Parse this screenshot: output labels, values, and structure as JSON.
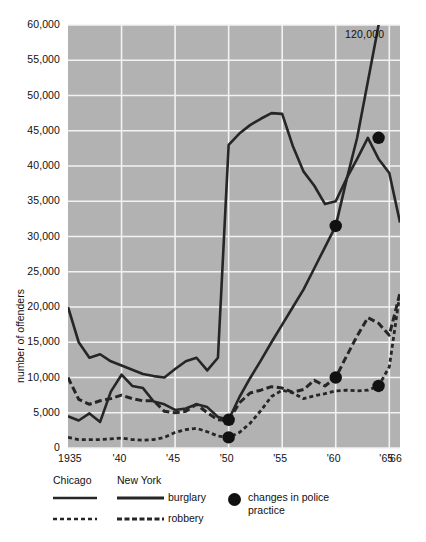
{
  "chart_data": {
    "type": "line",
    "title": "",
    "xlabel": "",
    "ylabel": "number of offenders",
    "xlim": [
      1935,
      1966
    ],
    "ylim": [
      0,
      60000
    ],
    "grid": true,
    "legend_position": "below",
    "annotations": [
      {
        "text": "120,000",
        "x": 1964.6,
        "y": 58000,
        "note": "Chicago burglary value off the top of the scale"
      }
    ],
    "y_ticks": [
      0,
      5000,
      10000,
      15000,
      20000,
      25000,
      30000,
      35000,
      40000,
      45000,
      50000,
      55000,
      60000
    ],
    "y_tick_labels": [
      "0",
      "5,000",
      "10,000",
      "15,000",
      "20,000",
      "25,000",
      "30,000",
      "35,000",
      "40,000",
      "45,000",
      "50,000",
      "55,000",
      "60,000"
    ],
    "x_ticks": [
      1935,
      1940,
      1945,
      1950,
      1955,
      1960,
      1965,
      1966
    ],
    "x_tick_labels": [
      "1935",
      "'40",
      "'45",
      "'50",
      "'55",
      "'60",
      "'65",
      "'66"
    ],
    "x": [
      1935,
      1936,
      1937,
      1938,
      1939,
      1940,
      1941,
      1942,
      1943,
      1944,
      1945,
      1946,
      1947,
      1948,
      1949,
      1950,
      1951,
      1952,
      1953,
      1954,
      1955,
      1956,
      1957,
      1958,
      1959,
      1960,
      1961,
      1962,
      1963,
      1964,
      1965,
      1966
    ],
    "series": [
      {
        "name": "New York burglary",
        "city": "New York",
        "offense": "burglary",
        "style": "solid",
        "color": "#262626",
        "values": [
          20000,
          15000,
          12800,
          13300,
          12300,
          11700,
          11100,
          10500,
          10200,
          10000,
          11200,
          12300,
          12800,
          11000,
          12800,
          43000,
          44600,
          45800,
          46700,
          47500,
          47400,
          42800,
          39200,
          37200,
          34600,
          35000,
          38200,
          41000,
          44000,
          41000,
          39000,
          32000
        ]
      },
      {
        "name": "New York robbery",
        "city": "New York",
        "offense": "robbery",
        "style": "dashed-wide",
        "color": "#262626",
        "values": [
          10000,
          6900,
          6200,
          6700,
          7000,
          7500,
          7000,
          6700,
          6700,
          5200,
          5000,
          5200,
          6200,
          5000,
          4000,
          3900,
          6400,
          7800,
          8200,
          8700,
          8500,
          7900,
          8300,
          9600,
          8800,
          10000,
          13000,
          15900,
          18500,
          17700,
          16000,
          22000
        ]
      },
      {
        "name": "Chicago burglary",
        "city": "Chicago",
        "offense": "burglary",
        "style": "solid",
        "color": "#262626",
        "values": [
          4500,
          3900,
          4900,
          3700,
          8000,
          10400,
          8800,
          8500,
          6600,
          6200,
          5400,
          5600,
          6200,
          5800,
          4400,
          4000,
          7200,
          9900,
          12400,
          15000,
          17500,
          20000,
          22500,
          25500,
          28500,
          31500,
          38000,
          44000,
          52000,
          60000,
          90000,
          120000
        ]
      },
      {
        "name": "Chicago robbery",
        "city": "Chicago",
        "offense": "robbery",
        "style": "dotted",
        "color": "#262626",
        "values": [
          1500,
          1200,
          1200,
          1200,
          1300,
          1400,
          1200,
          1100,
          1200,
          1500,
          2200,
          2600,
          2800,
          2300,
          1700,
          1500,
          2200,
          3500,
          5300,
          7300,
          8200,
          7800,
          7000,
          7400,
          7700,
          8100,
          8200,
          8100,
          8200,
          8800,
          11500,
          22000
        ]
      }
    ],
    "markers": {
      "label": "changes in police practice",
      "points": [
        {
          "x": 1950,
          "y": 4000,
          "series": "Chicago burglary"
        },
        {
          "x": 1950,
          "y": 1500,
          "series": "Chicago robbery"
        },
        {
          "x": 1960,
          "y": 31500,
          "series": "Chicago burglary"
        },
        {
          "x": 1960,
          "y": 10000,
          "series": "New York robbery"
        },
        {
          "x": 1964,
          "y": 44000,
          "series": "Chicago burglary"
        },
        {
          "x": 1964,
          "y": 8800,
          "series": "Chicago robbery"
        }
      ]
    },
    "legend": {
      "columns": [
        "Chicago",
        "New York"
      ],
      "rows": [
        {
          "label": "burglary",
          "style": "solid"
        },
        {
          "label": "robbery",
          "style": "dashed"
        }
      ],
      "marker_label_line1": "changes in police",
      "marker_label_line2": "practice"
    },
    "colors": {
      "plot_background": "#b2b2b2",
      "gridline": "#f2f2f2",
      "line": "#262626",
      "page_background": "#ffffff",
      "text": "#111111"
    }
  }
}
